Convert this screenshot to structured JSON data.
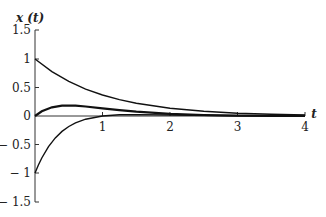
{
  "chart_data": {
    "type": "line",
    "title": "",
    "xlabel": "t",
    "ylabel": "x(t)",
    "xlim": [
      0,
      4
    ],
    "ylim": [
      -1.5,
      1.5
    ],
    "grid": false,
    "legend": null,
    "x_ticks": [
      "1",
      "2",
      "3",
      "4"
    ],
    "y_ticks": [
      "1.5",
      "1",
      "0.5",
      "0",
      "− 0.5",
      "− 1",
      "− 1.5"
    ],
    "series": [
      {
        "name": "upper decaying curve",
        "x": [
          0,
          0.25,
          0.5,
          0.75,
          1,
          1.25,
          1.5,
          2,
          2.5,
          3,
          3.5,
          4
        ],
        "y": [
          1,
          0.779,
          0.607,
          0.472,
          0.368,
          0.287,
          0.223,
          0.135,
          0.082,
          0.05,
          0.03,
          0.018
        ]
      },
      {
        "name": "hump curve",
        "x": [
          0,
          0.1,
          0.25,
          0.4,
          0.5,
          0.6,
          0.75,
          1,
          1.25,
          1.5,
          2,
          2.5,
          3,
          3.5,
          4
        ],
        "y": [
          0,
          0.082,
          0.152,
          0.18,
          0.184,
          0.181,
          0.167,
          0.135,
          0.103,
          0.075,
          0.037,
          0.017,
          0.007,
          0.003,
          0.001
        ]
      },
      {
        "name": "lower rising curve",
        "x": [
          0,
          0.05,
          0.1,
          0.2,
          0.3,
          0.4,
          0.5,
          0.6,
          0.75,
          1,
          1.25,
          1.5,
          2,
          3,
          4
        ],
        "y": [
          -1,
          -0.86,
          -0.737,
          -0.536,
          -0.384,
          -0.27,
          -0.184,
          -0.12,
          -0.056,
          0,
          0.021,
          0.025,
          0.018,
          0.005,
          0.001
        ]
      }
    ]
  },
  "labels": {
    "y_axis_title": "x (t)",
    "x_axis_title": "t"
  }
}
